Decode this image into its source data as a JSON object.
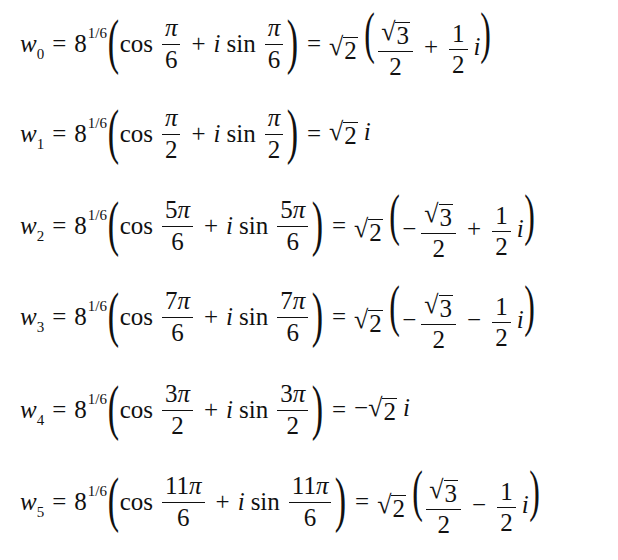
{
  "equations": [
    {
      "lhs": {
        "var": "w",
        "sub": "0"
      },
      "base": "8",
      "exp": "1/6",
      "cos_arg": {
        "num_coef": "",
        "num_sym": "π",
        "den": "6"
      },
      "sin_arg": {
        "num_coef": "",
        "num_sym": "π",
        "den": "6"
      },
      "rhs_text": "√2 (√3/2 + 1/2 i)",
      "rhs": {
        "prefix": "",
        "sqrt": "2",
        "form": "paren",
        "sign1": "",
        "re_num": "3",
        "re_den": "2",
        "sign2": "+",
        "im_num": "1",
        "im_den": "2",
        "i": "i"
      }
    },
    {
      "lhs": {
        "var": "w",
        "sub": "1"
      },
      "base": "8",
      "exp": "1/6",
      "cos_arg": {
        "num_coef": "",
        "num_sym": "π",
        "den": "2"
      },
      "sin_arg": {
        "num_coef": "",
        "num_sym": "π",
        "den": "2"
      },
      "rhs_text": "√2 i",
      "rhs": {
        "prefix": "",
        "sqrt": "2",
        "form": "simple",
        "i": "i"
      }
    },
    {
      "lhs": {
        "var": "w",
        "sub": "2"
      },
      "base": "8",
      "exp": "1/6",
      "cos_arg": {
        "num_coef": "5",
        "num_sym": "π",
        "den": "6"
      },
      "sin_arg": {
        "num_coef": "5",
        "num_sym": "π",
        "den": "6"
      },
      "rhs_text": "√2 (−√3/2 + 1/2 i)",
      "rhs": {
        "prefix": "",
        "sqrt": "2",
        "form": "paren",
        "sign1": "−",
        "re_num": "3",
        "re_den": "2",
        "sign2": "+",
        "im_num": "1",
        "im_den": "2",
        "i": "i"
      }
    },
    {
      "lhs": {
        "var": "w",
        "sub": "3"
      },
      "base": "8",
      "exp": "1/6",
      "cos_arg": {
        "num_coef": "7",
        "num_sym": "π",
        "den": "6"
      },
      "sin_arg": {
        "num_coef": "7",
        "num_sym": "π",
        "den": "6"
      },
      "rhs_text": "√2 (−√3/2 − 1/2 i)",
      "rhs": {
        "prefix": "",
        "sqrt": "2",
        "form": "paren",
        "sign1": "−",
        "re_num": "3",
        "re_den": "2",
        "sign2": "−",
        "im_num": "1",
        "im_den": "2",
        "i": "i"
      }
    },
    {
      "lhs": {
        "var": "w",
        "sub": "4"
      },
      "base": "8",
      "exp": "1/6",
      "cos_arg": {
        "num_coef": "3",
        "num_sym": "π",
        "den": "2"
      },
      "sin_arg": {
        "num_coef": "3",
        "num_sym": "π",
        "den": "2"
      },
      "rhs_text": "−√2 i",
      "rhs": {
        "prefix": "−",
        "sqrt": "2",
        "form": "simple",
        "i": "i"
      }
    },
    {
      "lhs": {
        "var": "w",
        "sub": "5"
      },
      "base": "8",
      "exp": "1/6",
      "cos_arg": {
        "num_coef": "11",
        "num_sym": "π",
        "den": "6"
      },
      "sin_arg": {
        "num_coef": "11",
        "num_sym": "π",
        "den": "6"
      },
      "rhs_text": "√2 (√3/2 − 1/2 i)",
      "rhs": {
        "prefix": "",
        "sqrt": "2",
        "form": "paren",
        "sign1": "",
        "re_num": "3",
        "re_den": "2",
        "sign2": "−",
        "im_num": "1",
        "im_den": "2",
        "i": "i"
      }
    }
  ],
  "symbols": {
    "equals": "=",
    "plus": "+",
    "cos": "cos",
    "sin": "sin",
    "i": "i",
    "lparen": "(",
    "rparen": ")",
    "radical": "√"
  }
}
